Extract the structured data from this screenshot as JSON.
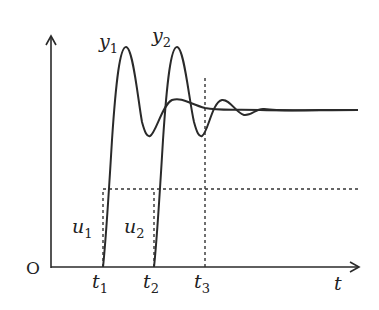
{
  "diagram": {
    "type": "step-response-plot",
    "axes": {
      "origin_label": "O",
      "x_label": "t",
      "y_label": ""
    },
    "curves": [
      {
        "name": "y1",
        "label_main": "y",
        "label_sub": "1",
        "start": "t1",
        "description": "underdamped response, large overshoot"
      },
      {
        "name": "y2",
        "label_main": "y",
        "label_sub": "2",
        "start": "t2",
        "description": "underdamped response, large overshoot, shifted by delay"
      }
    ],
    "inputs": [
      {
        "name": "u1",
        "label_main": "u",
        "label_sub": "1",
        "step_at": "t1"
      },
      {
        "name": "u2",
        "label_main": "u",
        "label_sub": "2",
        "step_at": "t2"
      }
    ],
    "time_markers": [
      {
        "name": "t1",
        "label_main": "t",
        "label_sub": "1"
      },
      {
        "name": "t2",
        "label_main": "t",
        "label_sub": "2"
      },
      {
        "name": "t3",
        "label_main": "t",
        "label_sub": "3"
      }
    ],
    "colors": {
      "line": "#2a2a2a",
      "dashed": "#333333",
      "background": "#ffffff"
    }
  }
}
